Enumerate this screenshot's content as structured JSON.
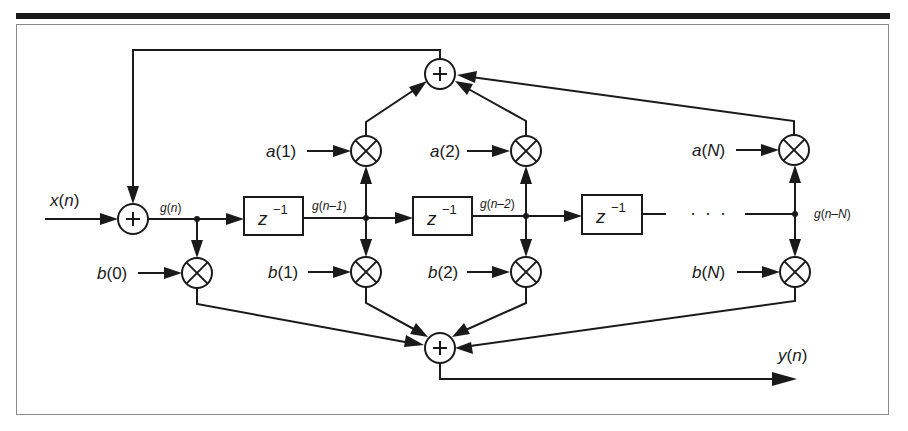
{
  "diagram": {
    "type": "Direct Form II IIR filter structure",
    "colors": {
      "line": "#1a1a1a",
      "background": "#ffffff",
      "top_rule": "#1a1a1a",
      "frame": "#8a8a8a"
    },
    "input_label": {
      "fn": "x",
      "arg": "n"
    },
    "output_label": {
      "fn": "y",
      "arg": "n"
    },
    "signal_labels": [
      {
        "fn": "g",
        "arg": "n"
      },
      {
        "fn": "g",
        "arg": "n–1"
      },
      {
        "fn": "g",
        "arg": "n–2"
      },
      {
        "fn": "g",
        "arg": "n–N"
      }
    ],
    "delay_blocks": [
      {
        "base": "z",
        "exp": "−1"
      },
      {
        "base": "z",
        "exp": "−1"
      },
      {
        "base": "z",
        "exp": "−1"
      }
    ],
    "feedback_coefficients": [
      {
        "fn": "a",
        "arg": "1"
      },
      {
        "fn": "a",
        "arg": "2"
      },
      {
        "fn": "a",
        "arg": "N"
      }
    ],
    "feedforward_coefficients": [
      {
        "fn": "b",
        "arg": "0"
      },
      {
        "fn": "b",
        "arg": "1"
      },
      {
        "fn": "b",
        "arg": "2"
      },
      {
        "fn": "b",
        "arg": "N"
      }
    ],
    "ellipsis": "· · ·",
    "adder_symbol": "+",
    "multiplier_symbol": "⊗"
  }
}
